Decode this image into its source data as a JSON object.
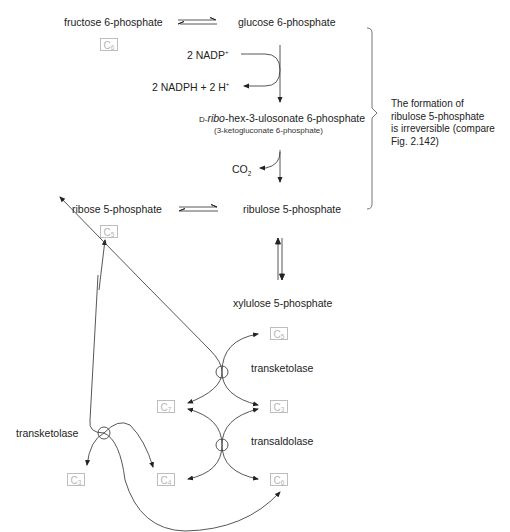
{
  "diagram": {
    "type": "metabolic-pathway",
    "metabolites": {
      "fructose_6p": "fructose 6-phosphate",
      "glucose_6p": "glucose 6-phosphate",
      "intermediate": "D-ribo-hex-3-ulosonate 6-phosphate",
      "intermediate_prefix": "D-",
      "intermediate_italic": "ribo",
      "intermediate_suffix": "-hex-3-ulosonate 6-phosphate",
      "intermediate_alt": "(3-ketogluconate 6-phosphate)",
      "ribose_5p": "ribose 5-phosphate",
      "ribulose_5p": "ribulose 5-phosphate",
      "xylulose_5p": "xylulose 5-phosphate"
    },
    "cofactors": {
      "nadp_in": "2 NADP",
      "nadp_in_sup": "+",
      "nadph_out": "2 NADPH + 2 H",
      "nadph_out_sup": "+",
      "co2": "CO",
      "co2_sub": "2"
    },
    "enzymes": {
      "transketolase_right": "transketolase",
      "transaldolase": "transaldolase",
      "transketolase_left": "transketolase"
    },
    "carbon_boxes": [
      {
        "id": "c6-top",
        "letter": "C",
        "n": "6"
      },
      {
        "id": "c5-ribose",
        "letter": "C",
        "n": "5"
      },
      {
        "id": "c5-xylulose",
        "letter": "C",
        "n": "5"
      },
      {
        "id": "c7",
        "letter": "C",
        "n": "7"
      },
      {
        "id": "c3-right",
        "letter": "C",
        "n": "3"
      },
      {
        "id": "c3-left",
        "letter": "C",
        "n": "3"
      },
      {
        "id": "c4",
        "letter": "C",
        "n": "4"
      },
      {
        "id": "c6-bottom",
        "letter": "C",
        "n": "6"
      }
    ],
    "note": {
      "line1": "The formation of",
      "line2": "ribulose 5-phosphate",
      "line3": "is irreversible (compare",
      "line4": "Fig. 2.142)"
    },
    "colors": {
      "line": "#333333",
      "box_border": "#bdbdbd",
      "box_text": "#b5b5b5",
      "text": "#222222"
    }
  }
}
